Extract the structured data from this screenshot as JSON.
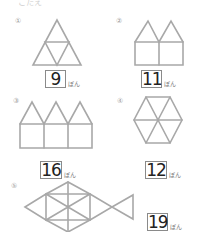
{
  "header": {
    "cut_text": "こたえ"
  },
  "problems": [
    {
      "label": "①",
      "answer": "9",
      "unit": "ぼん",
      "shape": "big-triangle-of-4-triangles"
    },
    {
      "label": "②",
      "answer": "11",
      "unit": "ぼん",
      "shape": "two-houses"
    },
    {
      "label": "③",
      "answer": "16",
      "unit": "ぼん",
      "shape": "three-houses"
    },
    {
      "label": "④",
      "answer": "12",
      "unit": "ぼん",
      "shape": "hexagon-of-6-triangles"
    },
    {
      "label": "⑤",
      "answer": "19",
      "unit": "ぼん",
      "shape": "fish"
    }
  ],
  "colors": {
    "stick": "#a8a8a8",
    "box_border": "#8a8a8a",
    "answer_text": "#222222"
  }
}
